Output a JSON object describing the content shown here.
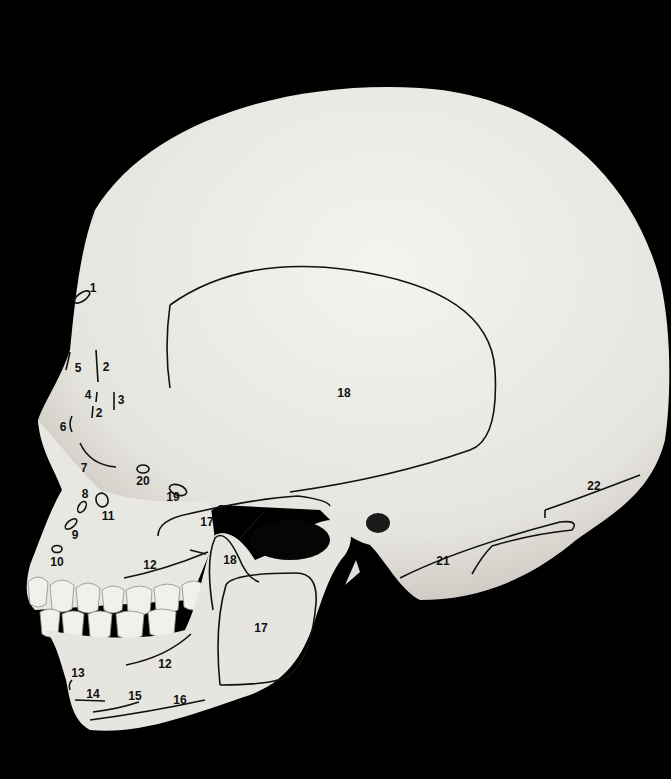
{
  "image": {
    "subject": "Human skull, left lateral view, with numbered anatomical regions",
    "background_color": "#000000",
    "bone_color": "#ecebe6",
    "line_color": "#111111"
  },
  "labels": [
    {
      "id": "1",
      "text": "1",
      "x": 93,
      "y": 288
    },
    {
      "id": "2a",
      "text": "2",
      "x": 106,
      "y": 367
    },
    {
      "id": "2b",
      "text": "2",
      "x": 99,
      "y": 413
    },
    {
      "id": "3",
      "text": "3",
      "x": 121,
      "y": 400
    },
    {
      "id": "4",
      "text": "4",
      "x": 88,
      "y": 395
    },
    {
      "id": "5",
      "text": "5",
      "x": 78,
      "y": 368
    },
    {
      "id": "6",
      "text": "6",
      "x": 63,
      "y": 427
    },
    {
      "id": "7",
      "text": "7",
      "x": 84,
      "y": 468
    },
    {
      "id": "8",
      "text": "8",
      "x": 85,
      "y": 494
    },
    {
      "id": "9",
      "text": "9",
      "x": 75,
      "y": 535
    },
    {
      "id": "10",
      "text": "10",
      "x": 57,
      "y": 562
    },
    {
      "id": "11",
      "text": "11",
      "x": 108,
      "y": 516
    },
    {
      "id": "12a",
      "text": "12",
      "x": 150,
      "y": 565
    },
    {
      "id": "12b",
      "text": "12",
      "x": 165,
      "y": 664
    },
    {
      "id": "13",
      "text": "13",
      "x": 78,
      "y": 673
    },
    {
      "id": "14",
      "text": "14",
      "x": 93,
      "y": 694
    },
    {
      "id": "15",
      "text": "15",
      "x": 135,
      "y": 696
    },
    {
      "id": "16",
      "text": "16",
      "x": 180,
      "y": 700
    },
    {
      "id": "17a",
      "text": "17",
      "x": 207,
      "y": 522
    },
    {
      "id": "17b",
      "text": "17",
      "x": 261,
      "y": 628
    },
    {
      "id": "18a",
      "text": "18",
      "x": 344,
      "y": 393
    },
    {
      "id": "18b",
      "text": "18",
      "x": 230,
      "y": 560
    },
    {
      "id": "19",
      "text": "19",
      "x": 173,
      "y": 497
    },
    {
      "id": "20",
      "text": "20",
      "x": 143,
      "y": 481
    },
    {
      "id": "21",
      "text": "21",
      "x": 443,
      "y": 561
    },
    {
      "id": "22",
      "text": "22",
      "x": 594,
      "y": 486
    }
  ]
}
